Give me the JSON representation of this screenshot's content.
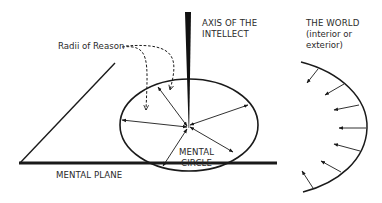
{
  "labels": {
    "radii": "Radii of Reason",
    "axis_line1": "AXIS OF THE",
    "axis_line2": "INTELLECT",
    "world_line1": "THE WORLD",
    "world_line2": "(interior or",
    "world_line3": "exterior)",
    "circle_line1": "MENTAL",
    "circle_line2": "CIRCLE",
    "plane": "MENTAL PLANE"
  },
  "colors": {
    "ink": "#1a1a1a",
    "text": "#2a2a2a",
    "background": "#ffffff"
  },
  "elements": {
    "mental_circle_arrows": 7,
    "world_inward_arrows": 7,
    "dashed_pointers": 2
  }
}
